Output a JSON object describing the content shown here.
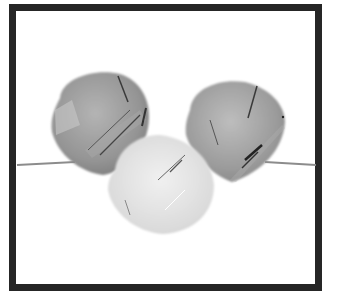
{
  "image": {
    "description": "Three faceted teardrop/briolette gemstone beads (rutilated quartz) strung on a thin wire, grayscale product photo inside a thick black square frame",
    "colors": {
      "frame": "#262626",
      "background": "#ffffff",
      "bead_dark": "#8a8a8a",
      "bead_light": "#d8d8d8",
      "wire": "#8c8c8c"
    },
    "beads": [
      {
        "name": "left-bead",
        "cx": 99,
        "cy": 122,
        "r": 50
      },
      {
        "name": "right-bead",
        "cx": 234,
        "cy": 128,
        "r": 48
      },
      {
        "name": "center-bead",
        "cx": 161,
        "cy": 183,
        "r": 53
      }
    ]
  }
}
